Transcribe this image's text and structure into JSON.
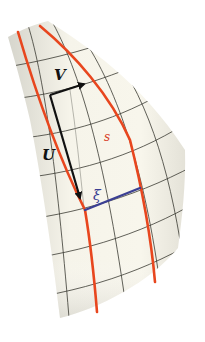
{
  "figure": {
    "labels": {
      "v": "V",
      "u": "U",
      "s": "s",
      "xi": "ξ"
    },
    "colors": {
      "surface": "#f3f1e8",
      "surface_shade": "#d9d8d0",
      "grid": "#3a3a32",
      "grid_light": "#8a8a82",
      "geodesic": "#e8461e",
      "xi_line": "#3b3f93",
      "vector": "#111111",
      "label_dark": "#111111",
      "label_s": "#d9432a",
      "label_xi": "#3b3f93"
    }
  }
}
